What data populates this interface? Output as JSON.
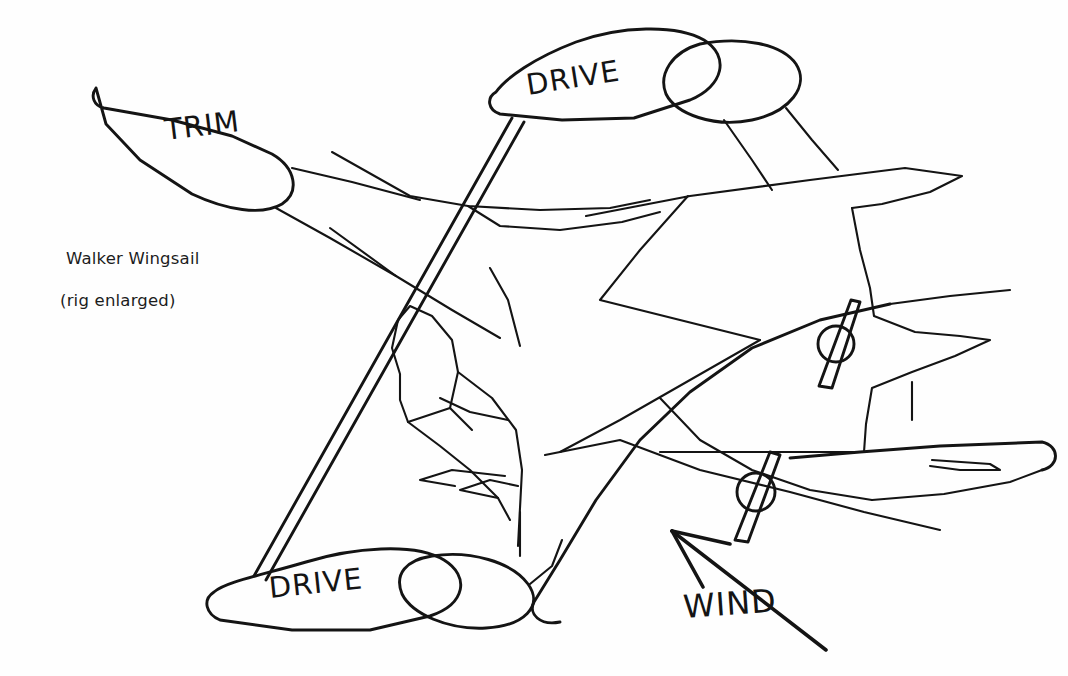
{
  "document": {
    "title": "Walker Wingsail (rig enlarged)",
    "medium": "hand-drawn line illustration",
    "background_color": "#fefefe",
    "ink_color": "#141414"
  },
  "caption": {
    "line_1": "Walker Wingsail",
    "line_2": "(rig enlarged)"
  },
  "labels": {
    "trim": "TRIM",
    "drive_upper": "DRIVE",
    "drive_lower": "DRIVE",
    "wind": "WIND"
  },
  "elements": {
    "trim_foil": "TRIM",
    "upper_drive_foil": "DRIVE",
    "upper_drive_flap": "flap",
    "lower_drive_foil": "DRIVE",
    "lower_drive_flap": "flap",
    "mast": "mast",
    "propeller_far": "propeller",
    "propeller_near": "propeller",
    "wind_arrow": "WIND"
  }
}
